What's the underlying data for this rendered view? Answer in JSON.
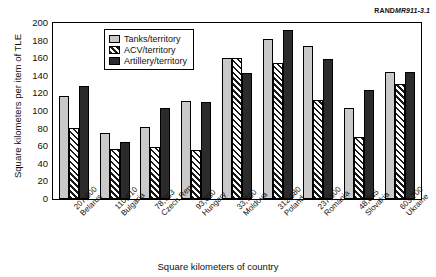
{
  "figure_id": {
    "rand": "RAND",
    "number": "MR911-3.1"
  },
  "chart_data": {
    "type": "bar",
    "title": "",
    "xlabel": "Square kilometers of country",
    "ylabel": "Square kilometers per item of TLE",
    "ylim": [
      0,
      200
    ],
    "yticks": [
      0,
      20,
      40,
      60,
      80,
      100,
      120,
      140,
      160,
      180,
      200
    ],
    "grid": false,
    "legend_position": "top-center-inside",
    "categories": [
      "207,600\nBelarus",
      "110,910\nBulgaria",
      "78,703\nCzech Rep.",
      "93,030\nHungary",
      "33,700\nMoldova",
      "312,680\nPoland",
      "237,500\nRomania",
      "48,845\nSlovakia",
      "603,700\nUkraine"
    ],
    "category_areas": [
      "207,600",
      "110,910",
      "78,703",
      "93,030",
      "33,700",
      "312,680",
      "237,500",
      "48,845",
      "603,700"
    ],
    "category_names": [
      "Belarus",
      "Bulgaria",
      "Czech Rep.",
      "Hungary",
      "Moldova",
      "Poland",
      "Romania",
      "Slovakia",
      "Ukraine"
    ],
    "series": [
      {
        "name": "Tanks/territory",
        "key": "tanks",
        "color": "#c9c9c9",
        "values": [
          117,
          75,
          82,
          111,
          160,
          182,
          174,
          103,
          145
        ]
      },
      {
        "name": "ACV/territory",
        "key": "acv",
        "color": "hatch-diagonal",
        "values": [
          81,
          57,
          59,
          56,
          160,
          155,
          113,
          70,
          131
        ]
      },
      {
        "name": "Artillery/territory",
        "key": "artillery",
        "color": "#2b2b2b",
        "values": [
          129,
          65,
          103,
          110,
          143,
          193,
          159,
          124,
          144
        ]
      }
    ]
  },
  "legend": {
    "items": [
      {
        "label": "Tanks/territory",
        "key": "tanks"
      },
      {
        "label": "ACV/territory",
        "key": "acv"
      },
      {
        "label": "Artillery/territory",
        "key": "artillery"
      }
    ]
  }
}
